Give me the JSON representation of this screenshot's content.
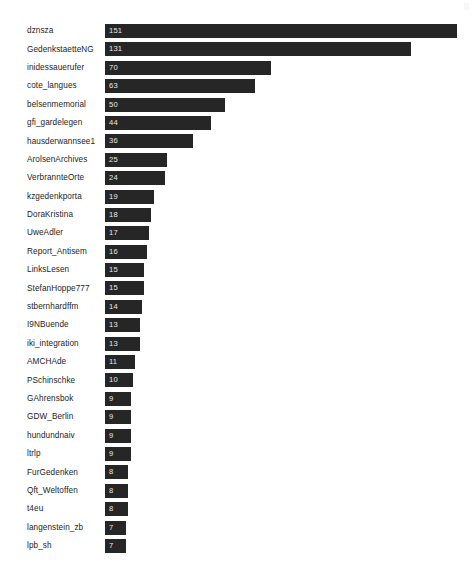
{
  "chart_data": {
    "type": "bar",
    "orientation": "horizontal",
    "title": "",
    "subtitle": "",
    "xlabel": "",
    "ylabel": "",
    "grid": false,
    "legend": null,
    "legend_position": "none",
    "axis_visible": false,
    "value_labels_inside_bars": true,
    "xlim": [
      0,
      151
    ],
    "bar_color": "#262626",
    "value_label_color": "#e8e8e8",
    "category_label_color": "#1d1d1d",
    "background_color": "#ffffff",
    "categories": [
      "dznsza",
      "GedenkstaetteNG",
      "inidessauerufer",
      "cote_langues",
      "belsenmemorial",
      "gfi_gardelegen",
      "hausderwannsee1",
      "ArolsenArchives",
      "VerbrannteOrte",
      "kzgedenkporta",
      "DoraKristina",
      "UweAdler",
      "Report_Antisem",
      "LinksLesen",
      "StefanHoppe777",
      "stbernhardffm",
      "I9NBuende",
      "iki_integration",
      "AMCHAde",
      "PSchinschke",
      "GAhrensbok",
      "GDW_Berlin",
      "hundundnaiv",
      "ltrlp",
      "FurGedenken",
      "Qft_Weltoffen",
      "t4eu",
      "langenstein_zb",
      "lpb_sh"
    ],
    "values": [
      151,
      131,
      70,
      63,
      50,
      44,
      36,
      25,
      24,
      19,
      18,
      17,
      16,
      15,
      15,
      14,
      13,
      13,
      11,
      10,
      9,
      9,
      9,
      9,
      8,
      8,
      8,
      7,
      7
    ]
  }
}
